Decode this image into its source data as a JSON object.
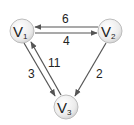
{
  "diagram": {
    "type": "directed-weighted-graph",
    "colors": {
      "node_fill_center": "#ffffff",
      "node_fill_edge": "#d0d0d0",
      "node_stroke": "#bdbdbd",
      "edge": "#555555",
      "text": "#222222"
    },
    "nodes": [
      {
        "id": "V1",
        "letter": "V",
        "sub": "1",
        "x": 22,
        "y": 31
      },
      {
        "id": "V2",
        "letter": "V",
        "sub": "2",
        "x": 110,
        "y": 31
      },
      {
        "id": "V3",
        "letter": "V",
        "sub": "3",
        "x": 66,
        "y": 107
      }
    ],
    "edges": [
      {
        "from": "V2",
        "to": "V1",
        "weight": "6"
      },
      {
        "from": "V1",
        "to": "V2",
        "weight": "4"
      },
      {
        "from": "V1",
        "to": "V3",
        "weight": "3"
      },
      {
        "from": "V3",
        "to": "V1",
        "weight": "11"
      },
      {
        "from": "V2",
        "to": "V3",
        "weight": "2"
      }
    ]
  }
}
